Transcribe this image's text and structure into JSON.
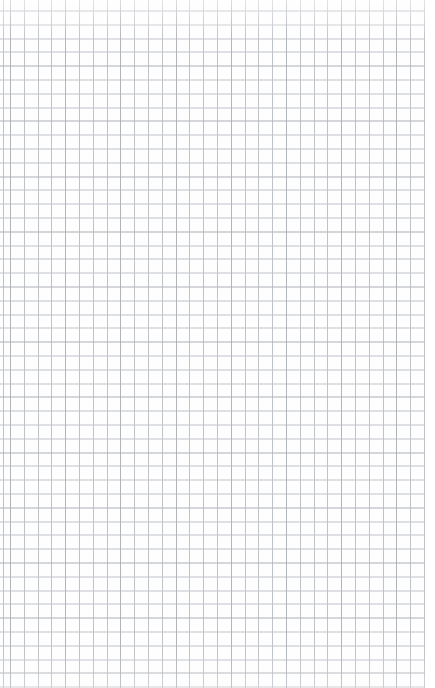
{
  "page": {
    "title": "Grid Paper",
    "width_px": 435,
    "height_px": 688,
    "background_color": "#fefefe",
    "visible_text": ""
  },
  "grid": {
    "name": "graph-paper-grid",
    "cell_size_px": 13.8,
    "line_color": "#bfc2c7",
    "accent_line_color": "#969aa0",
    "major_every_n_cells": 4,
    "origin_offset_x_px": 10,
    "origin_offset_y_px": 10.5,
    "vertical_line_count": 31,
    "horizontal_line_count": 50,
    "right_margin_px": 10,
    "right_margin_color": "#ffffff"
  }
}
